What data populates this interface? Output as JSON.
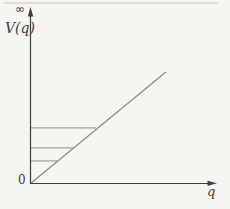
{
  "figure": {
    "labels": {
      "y_axis": "V(q)",
      "y_axis_top": "∞",
      "x_axis": "q",
      "origin": "0"
    },
    "colors": {
      "paper": "#f6f5f1",
      "ink": "#3d3d3d",
      "curve": "#8e8e8e",
      "guide": "#9e9e9e"
    }
  },
  "chart_data": {
    "type": "line",
    "title": "",
    "xlabel": "q",
    "ylabel": "V(q)",
    "x_axis_end_label": "q",
    "y_axis_top_label": "∞",
    "origin_label": "0",
    "grid": false,
    "legend": false,
    "axis_numeric_scale": "none (qualitative sketch; axes unnumbered, y-axis marked 0 at origin and ∞ at top)",
    "series": [
      {
        "name": "V(q)",
        "style": "solid",
        "points_norm": [
          [
            0,
            0
          ],
          [
            0.728,
            0.652
          ]
        ]
      }
    ],
    "guide_lines_norm": [
      {
        "y": 0.325,
        "x_end": 0.352
      },
      {
        "y": 0.208,
        "x_end": 0.229
      },
      {
        "y": 0.132,
        "x_end": 0.143
      }
    ]
  }
}
